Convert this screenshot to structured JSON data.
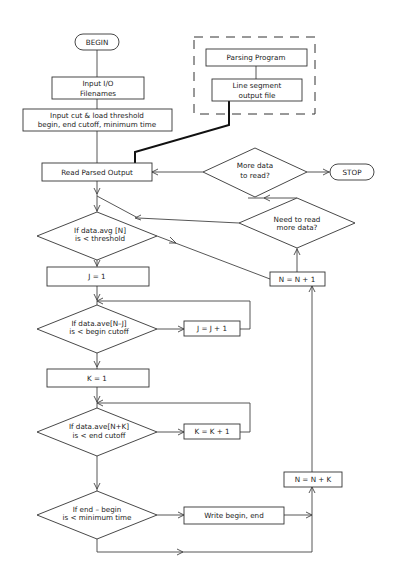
{
  "nodes": {
    "begin": "BEGIN",
    "stop": "STOP",
    "input_io": [
      "Input I/O",
      "Filenames"
    ],
    "input_cut": [
      "Input cut & load threshold",
      "begin, end cutoff, minimum time"
    ],
    "parsing_program": "Parsing Program",
    "line_segment": [
      "Line segment",
      "output file"
    ],
    "read_parsed": "Read Parsed Output",
    "more_data": [
      "More data",
      "to read?"
    ],
    "need_to_read": [
      "Need to read",
      "more data?"
    ],
    "if_avg": [
      "If data.avg [N]",
      "is < threshold"
    ],
    "n_plus_1": "N = N + 1",
    "j_eq_1": "J = 1",
    "if_begin": [
      "If data.ave[N–J]",
      "is < begin cutoff"
    ],
    "j_plus_1": "J = J + 1",
    "k_eq_1": "K = 1",
    "if_end": [
      "If data.ave[N+K]",
      "is < end cutoff"
    ],
    "k_plus_1": "K = K + 1",
    "n_plus_k": "N = N + K",
    "if_min": [
      "If end – begin",
      "is < minimum time"
    ],
    "write": "Write begin, end"
  },
  "colors": {
    "stroke": "#333333",
    "background": "#ffffff",
    "text": "#222222"
  }
}
